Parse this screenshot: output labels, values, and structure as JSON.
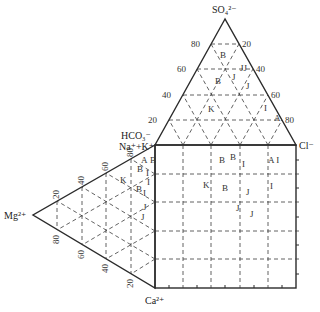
{
  "diagram": {
    "type": "piper-trilinear",
    "ions": {
      "top": "SO₄²⁻",
      "right": "Cl⁻",
      "hco3": "HCO₃⁻",
      "nak": "Na⁺+K⁺",
      "left": "Mg²⁺",
      "bottom": "Ca²⁺"
    },
    "top_triangle": {
      "left_ticks": [
        "20",
        "40",
        "60",
        "80"
      ],
      "right_ticks": [
        "20",
        "40",
        "60",
        "80"
      ]
    },
    "left_triangle": {
      "upper_ticks": [
        "20",
        "40",
        "60",
        "80"
      ],
      "lower_ticks": [
        "80",
        "60",
        "40",
        "20"
      ]
    },
    "points": {
      "top_triangle": [
        {
          "label": "B",
          "x": 220,
          "y": 58
        },
        {
          "label": "JJ",
          "x": 240,
          "y": 71
        },
        {
          "label": "J",
          "x": 232,
          "y": 80
        },
        {
          "label": "B",
          "x": 215,
          "y": 84
        },
        {
          "label": "J",
          "x": 246,
          "y": 89
        },
        {
          "label": "K",
          "x": 208,
          "y": 112
        },
        {
          "label": "I",
          "x": 264,
          "y": 111
        },
        {
          "label": "A",
          "x": 274,
          "y": 121
        }
      ],
      "square": [
        {
          "label": "B",
          "x": 219,
          "y": 163
        },
        {
          "label": "B",
          "x": 230,
          "y": 160
        },
        {
          "label": "I",
          "x": 242,
          "y": 167
        },
        {
          "label": "A I",
          "x": 268,
          "y": 163
        },
        {
          "label": "K",
          "x": 203,
          "y": 188
        },
        {
          "label": "B",
          "x": 222,
          "y": 191
        },
        {
          "label": "J",
          "x": 246,
          "y": 195
        },
        {
          "label": "I",
          "x": 270,
          "y": 189
        },
        {
          "label": "J",
          "x": 236,
          "y": 211
        },
        {
          "label": "J",
          "x": 250,
          "y": 217
        }
      ],
      "left_triangle": [
        {
          "label": "A",
          "x": 141,
          "y": 163
        },
        {
          "label": "B",
          "x": 150,
          "y": 163
        },
        {
          "label": "B",
          "x": 137,
          "y": 172
        },
        {
          "label": "I",
          "x": 146,
          "y": 176
        },
        {
          "label": "I",
          "x": 147,
          "y": 185
        },
        {
          "label": "K",
          "x": 120,
          "y": 183
        },
        {
          "label": "B",
          "x": 136,
          "y": 192
        },
        {
          "label": "I",
          "x": 143,
          "y": 196
        },
        {
          "label": "J",
          "x": 143,
          "y": 210
        },
        {
          "label": "J",
          "x": 141,
          "y": 220
        }
      ]
    }
  }
}
